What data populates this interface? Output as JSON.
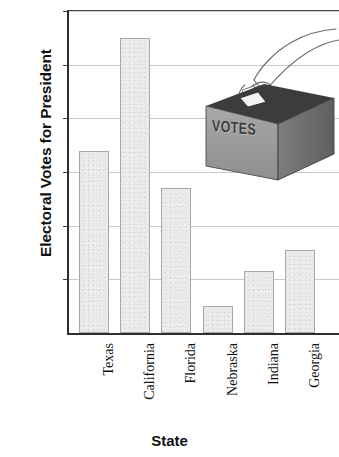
{
  "chart_data": {
    "type": "bar",
    "title": "",
    "xlabel": "State",
    "ylabel": "Electoral Votes for President",
    "categories": [
      "Texas",
      "California",
      "Florida",
      "Nebraska",
      "Indiana",
      "Georgia"
    ],
    "values": [
      34,
      55,
      27,
      5,
      11.5,
      15.5
    ],
    "ylim": [
      0,
      60
    ],
    "yticks": [
      0,
      10,
      20,
      30,
      40,
      50,
      60
    ],
    "ytick_labels": [
      "0",
      "10",
      "20",
      "30",
      "40",
      "50",
      "60"
    ],
    "grid": true,
    "legend": false,
    "bar_fill_color": "#ececec",
    "bar_edge_color": "#a8a8a8",
    "axis_color": "#2e2e2e",
    "gridline_color": "#c9c9c9"
  },
  "illustration": {
    "name": "ballot-box-with-hand",
    "box_label": "VOTES",
    "box_front_color": "#9a9a9a",
    "box_side_color": "#6f6f6f",
    "box_top_color": "#3c3c3c"
  }
}
